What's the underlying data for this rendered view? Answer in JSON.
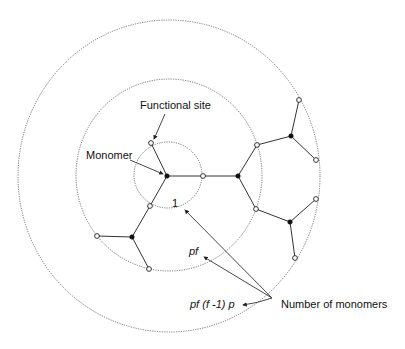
{
  "diagram": {
    "type": "branching-polymer-generations",
    "labels": {
      "functional_site": "Functional site",
      "monomer": "Monomer",
      "gen0_count": "1",
      "gen1_count": "pf",
      "gen2_count": "pf (f -1) p",
      "number_of_monomers": "Number of monomers"
    },
    "rings": [
      {
        "name": "inner",
        "cx": 168,
        "cy": 175,
        "rx": 34,
        "ry": 33
      },
      {
        "name": "middle",
        "cx": 169,
        "cy": 175,
        "rx": 93,
        "ry": 96
      },
      {
        "name": "outer",
        "cx": 169,
        "cy": 176,
        "rx": 151,
        "ry": 156
      }
    ],
    "legend": {
      "open_circle": "functional site",
      "solid_circle": "monomer"
    },
    "colors": {
      "stroke": "#333333",
      "background": "#ffffff"
    }
  }
}
